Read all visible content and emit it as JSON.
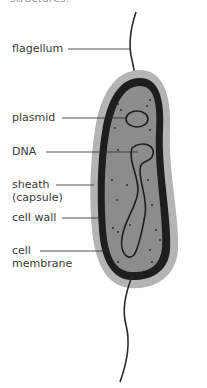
{
  "header": {
    "partial_text": "structures."
  },
  "diagram": {
    "colors": {
      "capsule": "#b4b4b4",
      "cell_wall": "#1e1e1e",
      "cytoplasm": "#8c8c8c",
      "lines": "#2a2a2a",
      "text": "#3a3a3a"
    },
    "labels": [
      {
        "id": "flagellum",
        "text": "flagellum"
      },
      {
        "id": "plasmid",
        "text": "plasmid"
      },
      {
        "id": "dna",
        "text": "DNA"
      },
      {
        "id": "sheath",
        "line1": "sheath",
        "line2": "(capsule)"
      },
      {
        "id": "cell_wall",
        "text": "cell wall"
      },
      {
        "id": "cell_membrane",
        "line1": "cell",
        "line2": "membrane"
      }
    ]
  }
}
